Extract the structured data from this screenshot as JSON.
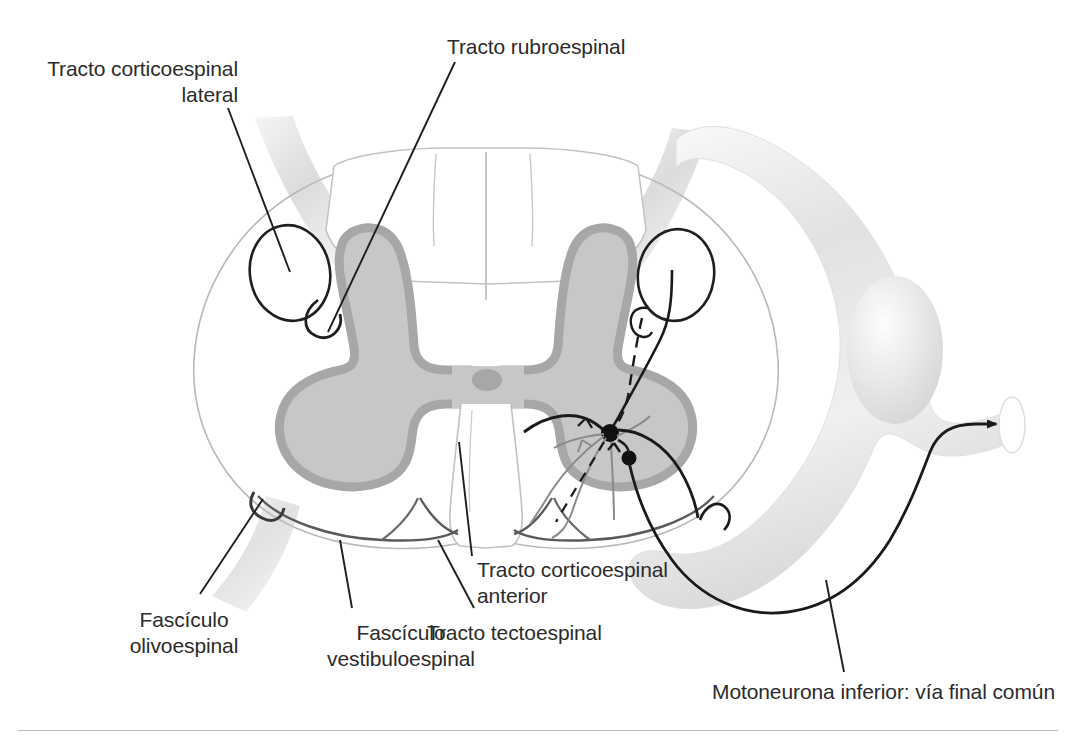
{
  "figure": {
    "language": "es",
    "background_color": "#ffffff",
    "text_color": "#2b2b2b",
    "rule_color": "#b9bcc0"
  },
  "labels": {
    "corticospinal_lateral": "Tracto corticoespinal\nlateral",
    "rubroespinal": "Tracto rubroespinal",
    "olivoespinal": "Fascículo\nolivoespinal",
    "vestibuloespinal": "Fascículo\nvestibuloespinal",
    "tectoespinal": "Tracto tectoespinal",
    "corticospinal_anterior": "Tracto corticoespinal\nanterior",
    "motoneurona": "Motoneurona inferior: vía final común"
  },
  "anatomy": {
    "gray_matter_fill": "#c7c7c7",
    "gray_matter_border": "#a9a9a9",
    "white_matter_outline": "#b5b5b5",
    "nerve_root_fill": "#e8e8e8",
    "nerve_root_shade": "#d2d2d2",
    "neuron_line": "#1a1a1a",
    "parts": [
      {
        "name": "white-matter-outline",
        "type": "cord-boundary"
      },
      {
        "name": "gray-matter-butterfly",
        "type": "gray-matter"
      },
      {
        "name": "central-canal",
        "type": "canal"
      },
      {
        "name": "posterior-columns",
        "type": "dorsal-funiculus"
      },
      {
        "name": "anterior-median-fissure",
        "type": "fissure"
      },
      {
        "name": "dorsal-root-left",
        "type": "nerve-root"
      },
      {
        "name": "dorsal-root-right",
        "type": "nerve-root"
      },
      {
        "name": "ventral-root-left",
        "type": "nerve-root"
      },
      {
        "name": "spinal-nerve-loop-right",
        "type": "nerve-loop"
      },
      {
        "name": "dorsal-root-ganglion",
        "type": "ganglion"
      },
      {
        "name": "lower-motor-neuron-axon",
        "type": "axon"
      },
      {
        "name": "motor-neuron-soma-alpha",
        "type": "soma"
      },
      {
        "name": "motor-neuron-soma-gamma",
        "type": "soma"
      }
    ],
    "tract_markers": [
      {
        "name": "lateral-corticospinal-left",
        "shape": "ellipse"
      },
      {
        "name": "rubrospinal-left",
        "shape": "small-circle"
      },
      {
        "name": "lateral-corticospinal-right",
        "shape": "ellipse"
      },
      {
        "name": "rubrospinal-right",
        "shape": "dashed-line"
      }
    ]
  }
}
